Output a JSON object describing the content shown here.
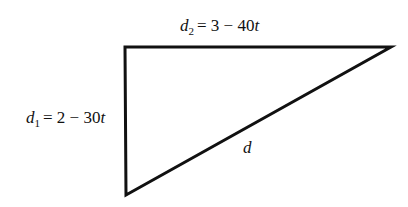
{
  "diagram": {
    "type": "right-triangle",
    "vertices": {
      "top_left": [
        125,
        47
      ],
      "top_right": [
        391,
        47
      ],
      "bottom_left": [
        126,
        195
      ]
    },
    "labels": {
      "top_side": {
        "var": "d",
        "sub": "2",
        "expr": "= 3 − 40",
        "t": "t"
      },
      "left_side": {
        "var": "d",
        "sub": "1",
        "expr": "= 2 − 30",
        "t": "t"
      },
      "hypotenuse": {
        "var": "d"
      }
    },
    "stroke_color": "#111111"
  }
}
